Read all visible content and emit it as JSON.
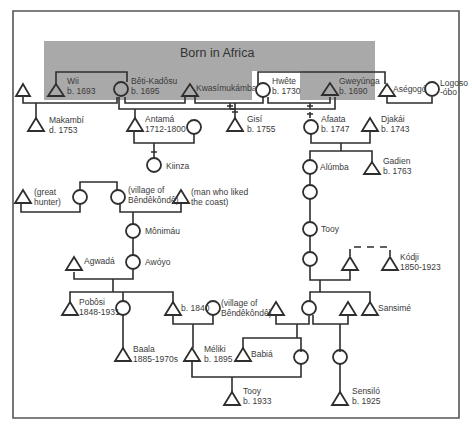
{
  "diagram": {
    "region_label": "Born in Africa",
    "colors": {
      "region_fill": "#a9a9a9",
      "line": "#2e2e2e",
      "frame": "#555555",
      "text": "#3a3a3a"
    },
    "legend_symbols": {
      "triangle": "male",
      "circle": "female"
    },
    "people": [
      {
        "id": "p1",
        "sex": "male",
        "label": [
          "",
          ""
        ]
      },
      {
        "id": "wii",
        "sex": "male",
        "label": [
          "Wii",
          "b. 1693"
        ]
      },
      {
        "id": "beti",
        "sex": "female",
        "label": [
          "Bêti-Kadôsu",
          "b. 1695"
        ]
      },
      {
        "id": "kwasi",
        "sex": "male",
        "label": [
          "Kwasímukámba",
          ""
        ]
      },
      {
        "id": "hwete",
        "sex": "female",
        "label": [
          "Hwête",
          "b. 1730"
        ]
      },
      {
        "id": "gweyunga",
        "sex": "male",
        "label": [
          "Gweyúnga",
          "b. 1690"
        ]
      },
      {
        "id": "asegogo",
        "sex": "male",
        "label": [
          "Aségogó",
          ""
        ]
      },
      {
        "id": "logoso",
        "sex": "female",
        "label": [
          "Logoso",
          "-óbo"
        ]
      },
      {
        "id": "makambi",
        "sex": "male",
        "label": [
          "Makambí",
          "d. 1753"
        ]
      },
      {
        "id": "antama",
        "sex": "male",
        "label": [
          "Antamá",
          "1712-1800"
        ]
      },
      {
        "id": "antama_w",
        "sex": "female",
        "label": [
          "",
          ""
        ]
      },
      {
        "id": "gisi",
        "sex": "male",
        "label": [
          "Gisí",
          "b. 1755"
        ]
      },
      {
        "id": "afaata",
        "sex": "female",
        "label": [
          "Afaata",
          "b. 1747"
        ]
      },
      {
        "id": "djakai",
        "sex": "male",
        "label": [
          "Djakái",
          "b. 1743"
        ]
      },
      {
        "id": "kiinza",
        "sex": "female",
        "label": [
          "Kiinza",
          ""
        ]
      },
      {
        "id": "alumba",
        "sex": "female",
        "label": [
          "Alúmba",
          ""
        ]
      },
      {
        "id": "gadien",
        "sex": "male",
        "label": [
          "Gadien",
          "b. 1763"
        ]
      },
      {
        "id": "hunter",
        "sex": "male",
        "label": [
          "(great",
          "hunter)"
        ]
      },
      {
        "id": "hunter_w",
        "sex": "female",
        "label": [
          "",
          ""
        ]
      },
      {
        "id": "bende_w",
        "sex": "female",
        "label": [
          "(village of",
          "Bêndêkôndê)"
        ]
      },
      {
        "id": "coast",
        "sex": "male",
        "label": [
          "(man who liked",
          "the coast)"
        ]
      },
      {
        "id": "monimau",
        "sex": "female",
        "label": [
          "Mônimáu",
          ""
        ]
      },
      {
        "id": "f_unnamed1",
        "sex": "female",
        "label": [
          "",
          ""
        ]
      },
      {
        "id": "tooy_f",
        "sex": "female",
        "label": [
          "Tooy",
          ""
        ]
      },
      {
        "id": "agwada",
        "sex": "male",
        "label": [
          "Agwadá",
          ""
        ]
      },
      {
        "id": "awoyo",
        "sex": "female",
        "label": [
          "Awóyo",
          ""
        ]
      },
      {
        "id": "f_unnamed2",
        "sex": "female",
        "label": [
          "",
          ""
        ]
      },
      {
        "id": "kodji_bro",
        "sex": "male",
        "label": [
          "",
          ""
        ]
      },
      {
        "id": "kodji",
        "sex": "male",
        "label": [
          "Kódji",
          "1850-1923"
        ]
      },
      {
        "id": "poboosi",
        "sex": "male",
        "label": [
          "Pobôsi",
          "1848-1931"
        ]
      },
      {
        "id": "pob_sis",
        "sex": "female",
        "label": [
          "",
          ""
        ]
      },
      {
        "id": "b1840",
        "sex": "male",
        "label": [
          "b. 1840",
          ""
        ]
      },
      {
        "id": "bende_w2",
        "sex": "female",
        "label": [
          "(village of",
          "Bêndêkôndê)"
        ]
      },
      {
        "id": "m_unnamed",
        "sex": "male",
        "label": [
          "",
          ""
        ]
      },
      {
        "id": "f_mid",
        "sex": "female",
        "label": [
          "",
          ""
        ]
      },
      {
        "id": "m_mid",
        "sex": "male",
        "label": [
          "",
          ""
        ]
      },
      {
        "id": "sansime",
        "sex": "male",
        "label": [
          "Sansimé",
          ""
        ]
      },
      {
        "id": "baala",
        "sex": "male",
        "label": [
          "Baala",
          "1885-1970s"
        ]
      },
      {
        "id": "meliki",
        "sex": "male",
        "label": [
          "Méliki",
          "b. 1895"
        ]
      },
      {
        "id": "babia",
        "sex": "male",
        "label": [
          "Babiá",
          ""
        ]
      },
      {
        "id": "f_babia",
        "sex": "female",
        "label": [
          "",
          ""
        ]
      },
      {
        "id": "f_sens",
        "sex": "female",
        "label": [
          "",
          ""
        ]
      },
      {
        "id": "tooy_m",
        "sex": "male",
        "label": [
          "Tooy",
          "b. 1933"
        ]
      },
      {
        "id": "sensilo",
        "sex": "male",
        "label": [
          "Sensiló",
          "b. 1925"
        ]
      }
    ]
  },
  "labels": {
    "wii": "Wii",
    "wii_b": "b. 1693",
    "beti": "Bêti-Kadôsu",
    "beti_b": "b. 1695",
    "kwasi": "Kwasímukámba",
    "hwete": "Hwête",
    "hwete_b": "b. 1730",
    "gweyunga": "Gweyúnga",
    "gweyunga_b": "b. 1690",
    "asegogo": "Aségogó",
    "logoso1": "Logoso",
    "logoso2": "-óbo",
    "makambi": "Makambí",
    "makambi_d": "d. 1753",
    "antama": "Antamá",
    "antama_d": "1712-1800",
    "gisi": "Gisí",
    "gisi_b": "b. 1755",
    "afaata": "Afaata",
    "afaata_b": "b. 1747",
    "djakai": "Djakái",
    "djakai_b": "b. 1743",
    "kiinza": "Kiinza",
    "alumba": "Alúmba",
    "gadien": "Gadien",
    "gadien_b": "b. 1763",
    "hunter1": "(great",
    "hunter2": "hunter)",
    "bende1": "(village of",
    "bende2": "Bêndêkôndê)",
    "coast1": "(man who liked",
    "coast2": "the coast)",
    "monimau": "Mônimáu",
    "tooy_f": "Tooy",
    "agwada": "Agwadá",
    "awoyo": "Awóyo",
    "kodji": "Kódji",
    "kodji_d": "1850-1923",
    "poboosi": "Pobôsi",
    "poboosi_d": "1848-1931",
    "b1840": "b. 1840",
    "bende3": "(village of",
    "bende4": "Bêndêkôndê)",
    "sansime": "Sansimé",
    "baala": "Baala",
    "baala_d": "1885-1970s",
    "meliki": "Méliki",
    "meliki_b": "b. 1895",
    "babia": "Babiá",
    "tooy_m": "Tooy",
    "tooy_m_b": "b. 1933",
    "sensilo": "Sensiló",
    "sensilo_b": "b. 1925"
  }
}
